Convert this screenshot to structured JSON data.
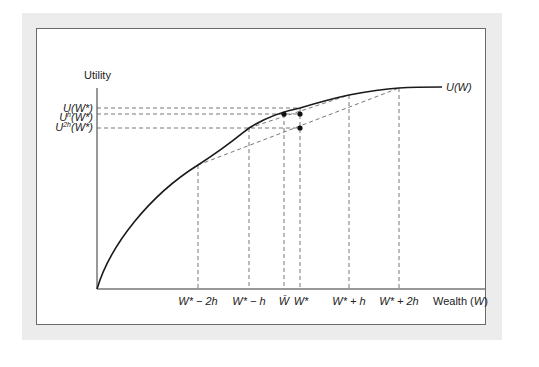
{
  "figure": {
    "y_axis_label": "Utility",
    "x_axis_label_prefix": "Wealth (",
    "x_axis_label_var": "W",
    "x_axis_label_suffix": ")",
    "curve_label": "U(W)",
    "y_ticks": [
      {
        "base": "U",
        "sup": "",
        "arg": "(W*)",
        "y": 108
      },
      {
        "base": "U",
        "sup": "h",
        "arg": "(W*)",
        "y": 114
      },
      {
        "base": "U",
        "sup": "2h",
        "arg": "(W*)",
        "y": 128
      }
    ],
    "x_ticks": [
      {
        "label": "W* − 2h",
        "x": 198
      },
      {
        "label": "W* − h",
        "x": 249
      },
      {
        "label": "W̄",
        "x": 284
      },
      {
        "label": "W*",
        "x": 300
      },
      {
        "label": "W* + h",
        "x": 349
      },
      {
        "label": "W* + 2h",
        "x": 399
      }
    ],
    "points": [
      {
        "name": "U-h-at-Wbar",
        "x": 284,
        "y": 114
      },
      {
        "name": "U-h-at-Wstar",
        "x": 300,
        "y": 114
      },
      {
        "name": "U-2h-at-Wstar",
        "x": 300,
        "y": 128
      }
    ],
    "colors": {
      "frame_bg": "#ececec",
      "panel_border": "#6a6a6a",
      "curve": "#1a1a1a",
      "dashed": "#555555"
    }
  }
}
